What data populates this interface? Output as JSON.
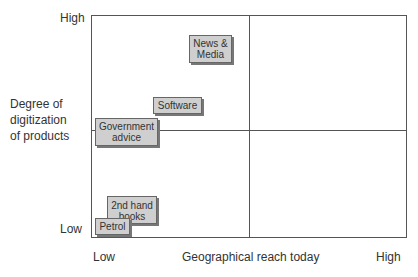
{
  "y_axis": {
    "title": "Degree of\ndigitization\nof products",
    "high": "High",
    "low": "Low"
  },
  "x_axis": {
    "title": "Geographical reach today",
    "low": "Low",
    "high": "High"
  },
  "items": [
    {
      "label": "News &\nMedia",
      "x_level": "low-mid",
      "y_level": "high"
    },
    {
      "label": "Software",
      "x_level": "low",
      "y_level": "mid-high"
    },
    {
      "label": "Government\nadvice",
      "x_level": "low",
      "y_level": "mid"
    },
    {
      "label": "2nd hand\nbooks",
      "x_level": "low",
      "y_level": "low"
    },
    {
      "label": "Petrol",
      "x_level": "lowest",
      "y_level": "lowest"
    }
  ],
  "colors": {
    "box_fill": "#cfcfcf",
    "line": "#555555"
  }
}
